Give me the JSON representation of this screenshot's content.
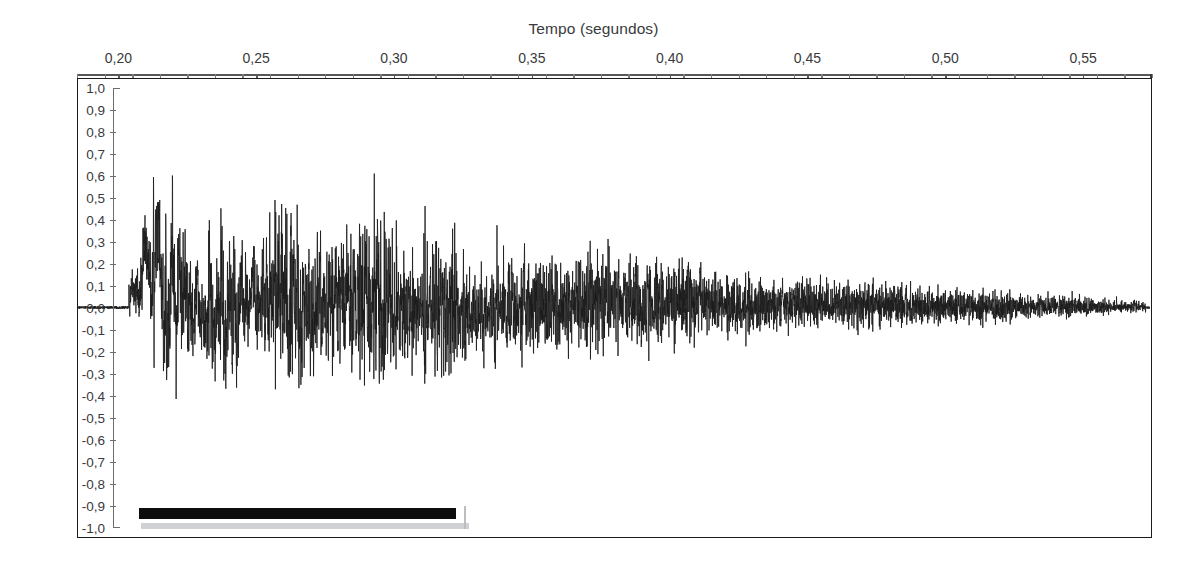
{
  "figure": {
    "background_color": "#ffffff",
    "ink_color": "#1b1b1b",
    "axis_color": "#58585b",
    "label_color": "#3a3a3c"
  },
  "axes": {
    "x_title": "Tempo (segundos)",
    "y_title": "Amplitude relativa",
    "x_ticks": [
      "0,20",
      "0,25",
      "0,30",
      "0,35",
      "0,40",
      "0,45",
      "0,50",
      "0,55"
    ],
    "y_ticks": [
      "1,0",
      "0,9",
      "0,8",
      "0,7",
      "0,6",
      "0,5",
      "0,4",
      "0,3",
      "0,2",
      "0,1",
      "0,0",
      "-0,1",
      "-0,2",
      "-0,3",
      "-0,4",
      "-0,5",
      "-0,6",
      "-0,7",
      "-0,8",
      "-0,9",
      "-1,0"
    ]
  },
  "annotation": {
    "marker_label": "",
    "marker_color": "#0d0d0d",
    "marker_shadow_color": "#c8c9cc"
  },
  "chart_data": {
    "type": "line",
    "title": "",
    "xlabel": "Tempo (segundos)",
    "ylabel": "Amplitude relativa",
    "xlim": [
      0.185,
      0.575
    ],
    "ylim": [
      -1.0,
      1.0
    ],
    "x_tick_values": [
      0.2,
      0.25,
      0.3,
      0.35,
      0.4,
      0.45,
      0.5,
      0.55
    ],
    "x_tick_labels": [
      "0,20",
      "0,25",
      "0,30",
      "0,35",
      "0,40",
      "0,45",
      "0,50",
      "0,55"
    ],
    "x_minor_tick_step": 0.01,
    "y_tick_values": [
      1.0,
      0.9,
      0.8,
      0.7,
      0.6,
      0.5,
      0.4,
      0.3,
      0.2,
      0.1,
      0.0,
      -0.1,
      -0.2,
      -0.3,
      -0.4,
      -0.5,
      -0.6,
      -0.7,
      -0.8,
      -0.9,
      -1.0
    ],
    "y_tick_labels": [
      "1,0",
      "0,9",
      "0,8",
      "0,7",
      "0,6",
      "0,5",
      "0,4",
      "0,3",
      "0,2",
      "0,1",
      "0,0",
      "-0,1",
      "-0,2",
      "-0,3",
      "-0,4",
      "-0,5",
      "-0,6",
      "-0,7",
      "-0,8",
      "-0,9",
      "-1,0"
    ],
    "grid": false,
    "legend": null,
    "series": [
      {
        "name": "forma de onda acustica",
        "description": "oscillogram of a sustained voiced sound with glottal pulse periodicity and exponential decay",
        "signal_onset_x": 0.2035,
        "signal_end_x": 0.5735,
        "silence_before_onset": true,
        "fundamental_period_s": 0.0047,
        "envelope": {
          "model": "piecewise-exponential-decay",
          "points": [
            {
              "x": 0.2035,
              "peak_pos": 0.18,
              "peak_neg": -0.16
            },
            {
              "x": 0.21,
              "peak_pos": 0.82,
              "peak_neg": -0.52
            },
            {
              "x": 0.216,
              "peak_pos": 0.95,
              "peak_neg": -0.88
            },
            {
              "x": 0.225,
              "peak_pos": 0.9,
              "peak_neg": -0.86
            },
            {
              "x": 0.235,
              "peak_pos": 0.8,
              "peak_neg": -0.78
            },
            {
              "x": 0.245,
              "peak_pos": 0.74,
              "peak_neg": -0.72
            },
            {
              "x": 0.258,
              "peak_pos": 0.94,
              "peak_neg": -0.9
            },
            {
              "x": 0.27,
              "peak_pos": 0.78,
              "peak_neg": -0.82
            },
            {
              "x": 0.282,
              "peak_pos": 0.76,
              "peak_neg": -0.8
            },
            {
              "x": 0.296,
              "peak_pos": 0.82,
              "peak_neg": -0.86
            },
            {
              "x": 0.308,
              "peak_pos": 0.66,
              "peak_neg": -0.72
            },
            {
              "x": 0.32,
              "peak_pos": 0.62,
              "peak_neg": -0.68
            },
            {
              "x": 0.33,
              "peak_pos": 0.5,
              "peak_neg": -0.54
            },
            {
              "x": 0.345,
              "peak_pos": 0.46,
              "peak_neg": -0.5
            },
            {
              "x": 0.36,
              "peak_pos": 0.54,
              "peak_neg": -0.56
            },
            {
              "x": 0.375,
              "peak_pos": 0.48,
              "peak_neg": -0.46
            },
            {
              "x": 0.39,
              "peak_pos": 0.4,
              "peak_neg": -0.42
            },
            {
              "x": 0.405,
              "peak_pos": 0.44,
              "peak_neg": -0.4
            },
            {
              "x": 0.42,
              "peak_pos": 0.34,
              "peak_neg": -0.34
            },
            {
              "x": 0.435,
              "peak_pos": 0.3,
              "peak_neg": -0.3
            },
            {
              "x": 0.45,
              "peak_pos": 0.28,
              "peak_neg": -0.26
            },
            {
              "x": 0.47,
              "peak_pos": 0.24,
              "peak_neg": -0.24
            },
            {
              "x": 0.49,
              "peak_pos": 0.2,
              "peak_neg": -0.2
            },
            {
              "x": 0.51,
              "peak_pos": 0.17,
              "peak_neg": -0.18
            },
            {
              "x": 0.53,
              "peak_pos": 0.14,
              "peak_neg": -0.14
            },
            {
              "x": 0.55,
              "peak_pos": 0.1,
              "peak_neg": -0.1
            },
            {
              "x": 0.5735,
              "peak_pos": 0.05,
              "peak_neg": -0.05
            }
          ]
        }
      }
    ],
    "annotations": [
      {
        "type": "duration-bar",
        "x_start": 0.2075,
        "x_end": 0.3225,
        "y": -0.93,
        "color": "#0d0d0d",
        "label": ""
      }
    ]
  }
}
